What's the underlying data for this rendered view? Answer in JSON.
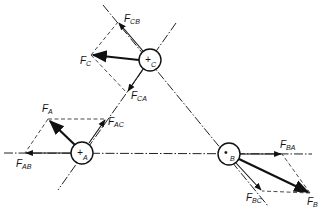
{
  "diagram": {
    "title": "",
    "bodies": [
      {
        "id": "A",
        "label": "A",
        "center": [
          82,
          153
        ],
        "marker": "+"
      },
      {
        "id": "B",
        "label": "B",
        "center": [
          229,
          154
        ],
        "marker": "•"
      },
      {
        "id": "C",
        "label": "C",
        "center": [
          150,
          60
        ],
        "marker": "+"
      }
    ],
    "forces": {
      "F_A": {
        "main": "F",
        "sub": "A"
      },
      "F_AB": {
        "main": "F",
        "sub": "AB"
      },
      "F_AC": {
        "main": "F",
        "sub": "AC"
      },
      "F_B": {
        "main": "F",
        "sub": "B"
      },
      "F_BA": {
        "main": "F",
        "sub": "BA"
      },
      "F_BC": {
        "main": "F",
        "sub": "BC"
      },
      "F_C": {
        "main": "F",
        "sub": "C"
      },
      "F_CA": {
        "main": "F",
        "sub": "CA"
      },
      "F_CB": {
        "main": "F",
        "sub": "CB"
      }
    },
    "colors": {
      "line": "#111111",
      "background": "#ffffff"
    }
  }
}
